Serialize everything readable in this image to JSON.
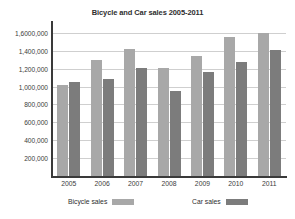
{
  "chart_data": {
    "type": "bar",
    "title": "Bicycle and Car sales 2005-2011",
    "xlabel": "",
    "ylabel": "",
    "categories": [
      "2005",
      "2006",
      "2007",
      "2008",
      "2009",
      "2010",
      "2011"
    ],
    "series": [
      {
        "name": "Bicycle sales",
        "color": "#a8a8a8",
        "values": [
          1020000,
          1300000,
          1420000,
          1210000,
          1340000,
          1550000,
          1600000
        ]
      },
      {
        "name": "Car sales",
        "color": "#7c7c7c",
        "values": [
          1050000,
          1090000,
          1210000,
          950000,
          1160000,
          1280000,
          1410000
        ]
      }
    ],
    "ylim": [
      0,
      1700000
    ],
    "y_ticks": [
      200000,
      400000,
      600000,
      800000,
      1000000,
      1200000,
      1400000,
      1600000
    ],
    "y_tick_labels": [
      "200,000",
      "400,000",
      "600,000",
      "800,000",
      "1,000,000",
      "1,200,000",
      "1,400,000",
      "1,6000,000"
    ],
    "grid": true,
    "legend_position": "bottom",
    "legend_entries": [
      "Bicycle sales",
      "Car sales"
    ]
  }
}
